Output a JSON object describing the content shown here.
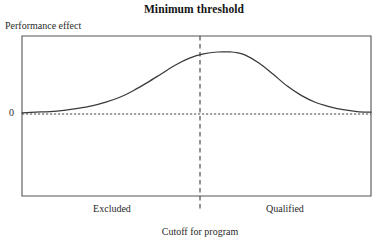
{
  "chart_data": {
    "type": "line",
    "title": "Minimum threshold",
    "xlabel": "Cutoff for program",
    "ylabel": "Performance effect",
    "ytick_labels": [
      "0"
    ],
    "annotations": [
      {
        "name": "left-region",
        "text": "Excluded"
      },
      {
        "name": "right-region",
        "text": "Qualified"
      },
      {
        "name": "cutoff-line",
        "text": "Cutoff for program"
      }
    ],
    "grid": false,
    "legend": null,
    "xlim": [
      0,
      100
    ],
    "ylim": [
      -0.06,
      1.15
    ],
    "cutoff_x": 61.5,
    "zero_line_y": 0,
    "series": [
      {
        "name": "Performance effect",
        "x": [
          0,
          4,
          8,
          12,
          16,
          20,
          24,
          28,
          32,
          36,
          40,
          44,
          48,
          52,
          56,
          60,
          61.5,
          64,
          68,
          72,
          76,
          80,
          84,
          88,
          92,
          96,
          100
        ],
        "values": [
          0.02,
          0.03,
          0.04,
          0.06,
          0.09,
          0.13,
          0.19,
          0.27,
          0.38,
          0.51,
          0.65,
          0.79,
          0.9,
          0.97,
          1.0,
          1.0,
          0.99,
          0.95,
          0.82,
          0.64,
          0.45,
          0.3,
          0.19,
          0.12,
          0.07,
          0.04,
          0.03
        ]
      }
    ]
  },
  "figure": {
    "title": "Minimum threshold",
    "y_axis_label": "Performance effect",
    "zero_label": "0",
    "x_axis_label": "Cutoff for program",
    "left_region_label": "Excluded",
    "right_region_label": "Qualified",
    "colors": {
      "curve": "#3a3a3a",
      "frame": "#555555",
      "zero_line": "#444444",
      "cutoff_line": "#444444",
      "text": "#1a1a1a",
      "background": "#ffffff"
    }
  }
}
